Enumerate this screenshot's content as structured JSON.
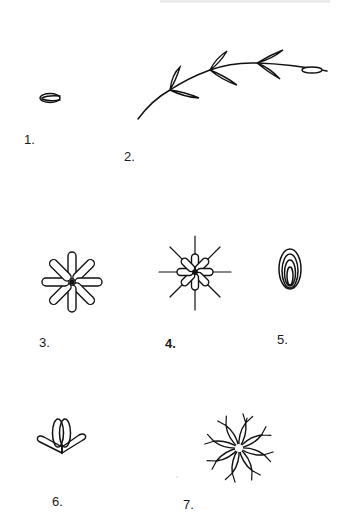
{
  "figure_sheet": {
    "ink_color": "#111111",
    "background": "#ffffff",
    "figures": [
      {
        "id": 1,
        "label": "1.",
        "description": "single flat seed / bud, side view",
        "label_pos": [
          27,
          140
        ],
        "center": [
          50,
          98
        ]
      },
      {
        "id": 2,
        "label": "2.",
        "description": "curved stem with alternating paired elongated florets, terminal floret",
        "label_pos": [
          127,
          157
        ],
        "stem": [
          [
            138,
            119
          ],
          [
            170,
            90
          ],
          [
            210,
            70
          ],
          [
            257,
            63
          ],
          [
            327,
            71
          ]
        ]
      },
      {
        "id": 3,
        "label": "3.",
        "description": "eight-petaled radial star of elongated lobes",
        "label_pos": [
          42,
          343
        ],
        "center": [
          72,
          282
        ],
        "petals": 8
      },
      {
        "id": 4,
        "label": "4.",
        "description": "eight short lobes with long radiating spokes",
        "label_pos": [
          168,
          344
        ],
        "center": [
          195,
          272
        ],
        "petals": 8
      },
      {
        "id": 5,
        "label": "5.",
        "description": "nested concentric ovals (closed bud)",
        "label_pos": [
          280,
          340
        ],
        "center": [
          290,
          269
        ]
      },
      {
        "id": 6,
        "label": "6.",
        "description": "two crossing upright loops on base with two angled side arms",
        "label_pos": [
          55,
          502
        ],
        "center": [
          62,
          445
        ]
      },
      {
        "id": 7,
        "label": "7.",
        "description": "eight-petaled star with forked tips",
        "label_pos": [
          186,
          505
        ],
        "center": [
          239,
          448
        ],
        "petals": 8
      }
    ]
  }
}
